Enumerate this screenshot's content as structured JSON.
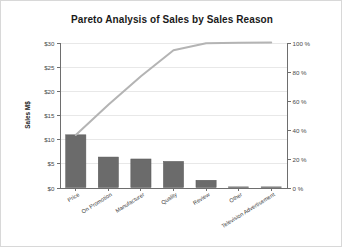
{
  "chart_data": {
    "type": "bar",
    "title": "Pareto Analysis of Sales by Sales Reason",
    "xlabel": "",
    "ylabel": "Sales M$",
    "y2label": "",
    "categories": [
      "Price",
      "On Promotion",
      "Manufacturer",
      "Quality",
      "Review",
      "Other",
      "Television Advertisement"
    ],
    "series": [
      {
        "name": "Sales M$",
        "type": "bar",
        "axis": "left",
        "values": [
          10.9,
          6.3,
          5.9,
          5.4,
          1.5,
          0.1,
          0.05
        ]
      },
      {
        "name": "Cumulative %",
        "type": "line",
        "axis": "right",
        "values": [
          36.2,
          57.1,
          76.7,
          94.6,
          99.5,
          99.8,
          100.0
        ]
      }
    ],
    "ylim": [
      0,
      30
    ],
    "y2lim": [
      0,
      100
    ],
    "yticks": [
      0,
      5,
      10,
      15,
      20,
      25,
      30
    ],
    "yticklabels": [
      "$0",
      "$5",
      "$10",
      "$15",
      "$20",
      "$25",
      "$30"
    ],
    "y2ticks": [
      0,
      20,
      40,
      60,
      80,
      100
    ],
    "y2ticklabels": [
      "0 %",
      "20 %",
      "40 %",
      "60 %",
      "80 %",
      "100 %"
    ],
    "grid": true,
    "legend": false,
    "colors": {
      "bar": "#6b6b6b",
      "line": "#b4b4b4",
      "grid": "#e8e8e8",
      "axis": "#6e6e6e",
      "text": "#1a1a1a",
      "background": "#ffffff",
      "border": "#d8d8d8"
    }
  }
}
